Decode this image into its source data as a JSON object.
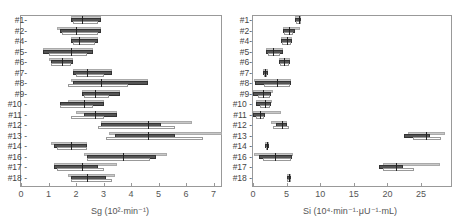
{
  "chart_data": [
    {
      "type": "box-range",
      "title": "",
      "xlabel": "Sg (10²·min⁻¹)",
      "ylabel": "",
      "xlim": [
        0,
        7.3
      ],
      "xticks": [
        0,
        1,
        2,
        3,
        4,
        5,
        6,
        7
      ],
      "grid": false,
      "categories": [
        "#1",
        "#2",
        "#4",
        "#5",
        "#6",
        "#7",
        "#8",
        "#9",
        "#10",
        "#11",
        "#12",
        "#13",
        "#14",
        "#16",
        "#17",
        "#18"
      ],
      "series": [
        {
          "name": "light",
          "color": "#c8c8c8",
          "ranges": [
            [
              1.8,
              2.9
            ],
            [
              1.3,
              2.9
            ],
            [
              1.8,
              2.8
            ],
            [
              0.8,
              2.6
            ],
            [
              1.0,
              1.9
            ],
            [
              1.9,
              3.3
            ],
            [
              1.8,
              4.6
            ],
            [
              2.2,
              3.6
            ],
            [
              1.7,
              3.0
            ],
            [
              2.0,
              3.5
            ],
            [
              2.9,
              6.2
            ],
            [
              3.2,
              7.3
            ],
            [
              1.1,
              2.4
            ],
            [
              2.3,
              5.3
            ],
            [
              1.2,
              3.5
            ],
            [
              1.7,
              3.4
            ]
          ]
        },
        {
          "name": "dark",
          "color": "#555555",
          "ranges": [
            [
              1.8,
              2.9
            ],
            [
              1.4,
              2.9
            ],
            [
              1.8,
              2.8
            ],
            [
              0.8,
              2.6
            ],
            [
              1.1,
              1.9
            ],
            [
              1.9,
              3.3
            ],
            [
              1.9,
              4.6
            ],
            [
              2.2,
              3.6
            ],
            [
              1.4,
              3.0
            ],
            [
              2.3,
              3.5
            ],
            [
              2.9,
              5.1
            ],
            [
              3.4,
              5.6
            ],
            [
              1.2,
              2.4
            ],
            [
              2.4,
              4.9
            ],
            [
              1.2,
              2.8
            ],
            [
              1.8,
              3.1
            ]
          ]
        },
        {
          "name": "white",
          "color": "#ffffff",
          "ranges": [
            [
              1.9,
              2.8
            ],
            [
              1.5,
              2.8
            ],
            [
              1.9,
              2.7
            ],
            [
              1.0,
              2.4
            ],
            [
              1.1,
              1.8
            ],
            [
              2.0,
              3.0
            ],
            [
              1.7,
              3.9
            ],
            [
              2.3,
              3.2
            ],
            [
              1.4,
              2.6
            ],
            [
              1.8,
              3.0
            ],
            [
              2.8,
              5.6
            ],
            [
              3.1,
              6.6
            ],
            [
              1.3,
              2.4
            ],
            [
              2.4,
              4.7
            ],
            [
              1.3,
              3.0
            ],
            [
              1.8,
              3.3
            ]
          ]
        }
      ],
      "medians": [
        2.2,
        2.0,
        2.1,
        1.8,
        1.5,
        2.4,
        2.9,
        2.7,
        2.3,
        2.7,
        4.6,
        4.6,
        1.8,
        3.7,
        2.2,
        2.4
      ]
    },
    {
      "type": "box-range",
      "title": "",
      "xlabel": "Si (10⁴·min⁻¹·μU⁻¹·mL)",
      "ylabel": "",
      "xlim": [
        0,
        29
      ],
      "xticks": [
        0,
        5,
        10,
        15,
        20,
        25
      ],
      "grid": false,
      "categories": [
        "#1",
        "#2",
        "#4",
        "#5",
        "#6",
        "#7",
        "#8",
        "#9",
        "#10",
        "#11",
        "#12",
        "#13",
        "#14",
        "#16",
        "#17",
        "#18"
      ],
      "series": [
        {
          "name": "light",
          "color": "#c8c8c8",
          "ranges": [
            [
              6.3,
              7.2
            ],
            [
              4.5,
              7.0
            ],
            [
              4.2,
              5.8
            ],
            [
              1.9,
              4.4
            ],
            [
              3.9,
              5.5
            ],
            [
              1.5,
              2.2
            ],
            [
              0.2,
              5.7
            ],
            [
              0.0,
              3.0
            ],
            [
              0.5,
              2.8
            ],
            [
              0.0,
              4.2
            ],
            [
              2.7,
              5.1
            ],
            [
              23.0,
              28.5
            ],
            [
              1.8,
              2.4
            ],
            [
              0.2,
              6.0
            ],
            [
              19.3,
              27.8
            ],
            [
              5.0,
              5.7
            ]
          ]
        },
        {
          "name": "dark",
          "color": "#555555",
          "ranges": [
            [
              6.3,
              7.2
            ],
            [
              4.5,
              6.2
            ],
            [
              4.2,
              5.8
            ],
            [
              1.9,
              4.4
            ],
            [
              3.9,
              5.5
            ],
            [
              1.5,
              2.2
            ],
            [
              0.3,
              5.6
            ],
            [
              0.0,
              2.7
            ],
            [
              0.4,
              2.7
            ],
            [
              0.0,
              1.8
            ],
            [
              3.4,
              5.1
            ],
            [
              22.5,
              26.3
            ],
            [
              1.8,
              2.4
            ],
            [
              0.9,
              5.8
            ],
            [
              18.8,
              22.3
            ],
            [
              5.0,
              5.7
            ]
          ]
        },
        {
          "name": "white",
          "color": "#ffffff",
          "ranges": [
            [
              6.4,
              7.1
            ],
            [
              4.6,
              6.0
            ],
            [
              4.3,
              5.6
            ],
            [
              2.2,
              4.0
            ],
            [
              4.0,
              5.3
            ],
            [
              1.6,
              2.1
            ],
            [
              1.6,
              5.5
            ],
            [
              0.8,
              2.5
            ],
            [
              1.1,
              2.5
            ],
            [
              0.4,
              1.6
            ],
            [
              3.0,
              5.4
            ],
            [
              23.8,
              28.0
            ],
            [
              1.9,
              2.3
            ],
            [
              1.5,
              5.6
            ],
            [
              19.3,
              24.0
            ],
            [
              5.0,
              5.6
            ]
          ]
        }
      ],
      "medians": [
        6.8,
        5.4,
        5.0,
        3.0,
        4.6,
        1.8,
        3.5,
        1.5,
        1.8,
        1.0,
        4.3,
        25.8,
        2.1,
        3.3,
        21.3,
        5.4
      ]
    }
  ],
  "left": {
    "xlabel": "Sg (10²·min⁻¹)",
    "ticks": [
      "0",
      "1",
      "2",
      "3",
      "4",
      "5",
      "6",
      "7"
    ]
  },
  "right": {
    "xlabel": "Si (10⁴·min⁻¹·μU⁻¹·mL)",
    "ticks": [
      "0",
      "5",
      "10",
      "15",
      "20",
      "25"
    ]
  },
  "rows": [
    "#1-",
    "#2-",
    "#4-",
    "#5-",
    "#6-",
    "#7-",
    "#8-",
    "#9-",
    "#10 -",
    "#11 -",
    "#12 -",
    "#13 -",
    "#14 -",
    "#16 -",
    "#17 -",
    "#18 -"
  ]
}
